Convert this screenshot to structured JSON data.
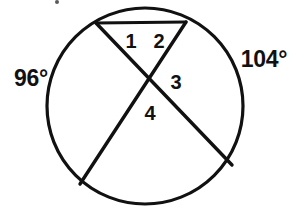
{
  "figure": {
    "background_color": "#ffffff",
    "stroke_color": "#111111",
    "text_color": "#111111"
  },
  "circle": {
    "center_x": 145,
    "center_y": 106,
    "radius": 98,
    "stroke_width": 3.2
  },
  "chords": [
    {
      "name": "top-chord",
      "x1": 96,
      "y1": 23,
      "x2": 186,
      "y2": 22,
      "stroke_width": 3.0
    },
    {
      "name": "chord-upper-left-to-lower-right",
      "x1": 96,
      "y1": 23,
      "x2": 232,
      "y2": 165,
      "stroke_width": 3.4
    },
    {
      "name": "chord-upper-right-to-lower-left",
      "x1": 186,
      "y1": 22,
      "x2": 80,
      "y2": 184,
      "stroke_width": 3.4
    }
  ],
  "intersection": {
    "x": 152,
    "y": 80
  },
  "angle_labels": [
    {
      "id": "angle-1",
      "text": "1",
      "x": 131,
      "y": 41
    },
    {
      "id": "angle-2",
      "text": "2",
      "x": 159,
      "y": 41
    },
    {
      "id": "angle-3",
      "text": "3",
      "x": 176,
      "y": 82
    },
    {
      "id": "angle-4",
      "text": "4",
      "x": 150,
      "y": 113
    }
  ],
  "arc_measures": [
    {
      "id": "arc-left",
      "text": "96°",
      "x": 31,
      "y": 78
    },
    {
      "id": "arc-right",
      "text": "104°",
      "x": 264,
      "y": 59
    }
  ],
  "artifacts": [
    {
      "id": "speck-top",
      "x": 57,
      "y": 2,
      "size": 4
    }
  ]
}
